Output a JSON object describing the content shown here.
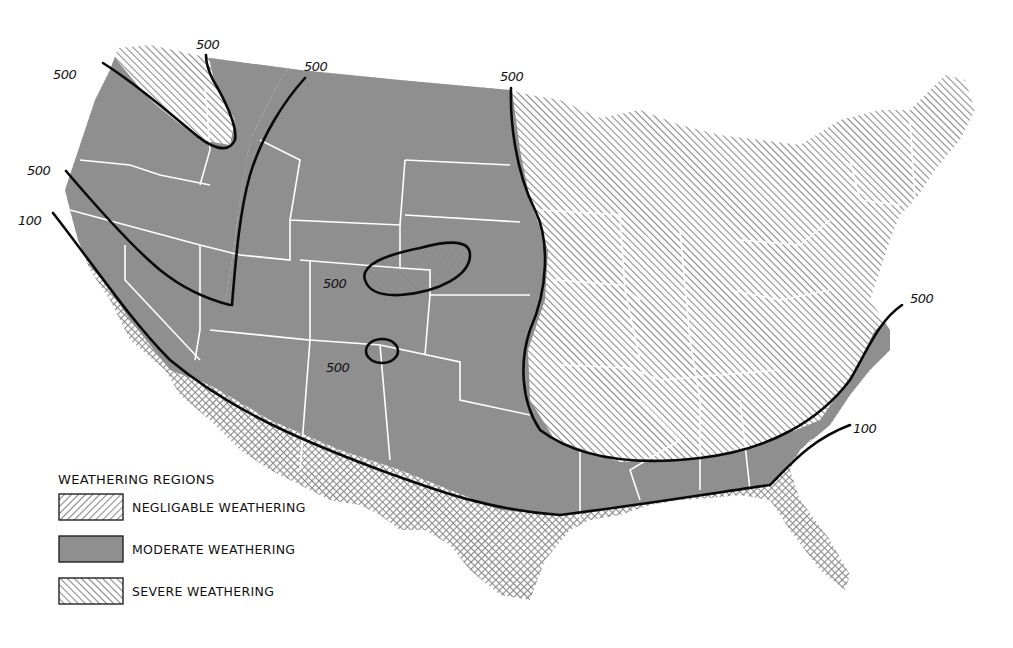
{
  "map": {
    "colors": {
      "moderate_fill": "#8f8f8f",
      "hatch_stroke": "#8a8a8a",
      "contour": "#0a0a0a",
      "state_lines": "#ffffff",
      "background": "#ffffff"
    },
    "contour_labels": [
      {
        "id": "nw-left",
        "text": "500"
      },
      {
        "id": "nw-top",
        "text": "500"
      },
      {
        "id": "nw-right",
        "text": "500"
      },
      {
        "id": "north-central",
        "text": "500"
      },
      {
        "id": "west-coast-500",
        "text": "500"
      },
      {
        "id": "west-coast-100",
        "text": "100"
      },
      {
        "id": "colorado-island",
        "text": "500"
      },
      {
        "id": "nm-island",
        "text": "500"
      },
      {
        "id": "east-500",
        "text": "500"
      },
      {
        "id": "east-100",
        "text": "100"
      }
    ]
  },
  "legend": {
    "title": "WEATHERING REGIONS",
    "items": [
      {
        "label": "NEGLIGABLE WEATHERING",
        "pattern": "back-hatch"
      },
      {
        "label": "MODERATE WEATHERING",
        "pattern": "solid-gray"
      },
      {
        "label": "SEVERE WEATHERING",
        "pattern": "forward-hatch"
      }
    ]
  }
}
